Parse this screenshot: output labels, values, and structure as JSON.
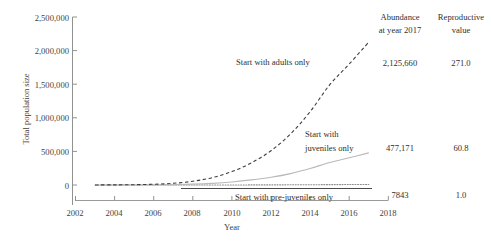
{
  "chart_data": {
    "type": "line",
    "title": "",
    "xlabel": "Year",
    "ylabel": "Total population size",
    "xlim": [
      2002,
      2018
    ],
    "ylim": [
      0,
      2500000
    ],
    "xticks": [
      "2002",
      "2004",
      "2006",
      "2008",
      "2010",
      "2012",
      "2014",
      "2016",
      "2018"
    ],
    "xtick_values": [
      2002,
      2004,
      2006,
      2008,
      2010,
      2012,
      2014,
      2016,
      2018
    ],
    "yticks": [
      "0",
      "500,000",
      "1,000,000",
      "1,500,000",
      "2,000,000",
      "2,500,000"
    ],
    "ytick_values": [
      0,
      500000,
      1000000,
      1500000,
      2000000,
      2500000
    ],
    "grid": false,
    "legend_position": "inline-annotations",
    "x": [
      2003,
      2004,
      2005,
      2006,
      2007,
      2008,
      2009,
      2010,
      2011,
      2012,
      2013,
      2014,
      2015,
      2016,
      2017
    ],
    "series": [
      {
        "name": "Start with adults only",
        "style": "dashed",
        "color": "#3d3d3d",
        "values": [
          900,
          2100,
          4800,
          11000,
          25000,
          56000,
          110000,
          200000,
          330000,
          510000,
          760000,
          1090000,
          1490000,
          1800000,
          2125660
        ]
      },
      {
        "name": "Start with juveniles only",
        "style": "solid",
        "color": "#b9b9b9",
        "values": [
          200,
          480,
          1100,
          2500,
          5700,
          12500,
          25000,
          45000,
          75000,
          115000,
          170000,
          245000,
          335000,
          405000,
          477171
        ]
      },
      {
        "name": "Start with pre-juveniles only",
        "style": "dotted",
        "color": "#8c8c8c",
        "values": [
          3,
          8,
          18,
          41,
          94,
          205,
          410,
          740,
          1220,
          1890,
          2800,
          4030,
          5500,
          6650,
          7843
        ]
      }
    ],
    "annotations": [
      {
        "text": "Start with adults only"
      },
      {
        "text": "Start with"
      },
      {
        "text": "juveniles only"
      },
      {
        "text": "Start with pre-juveniles only"
      }
    ]
  },
  "table": {
    "headers": {
      "abundance_line1": "Abundance",
      "abundance_line2": "at year 2017",
      "reproductive_line1": "Reproductive",
      "reproductive_line2": "value"
    },
    "rows": [
      {
        "abundance": "2,125,660",
        "reproductive": "271.0"
      },
      {
        "abundance": "477,171",
        "reproductive": "60.8"
      },
      {
        "abundance": "7843",
        "reproductive": "1.0"
      }
    ]
  },
  "colors": {
    "background": "#ffffff",
    "text": "#2f2f2f",
    "axis": "#8f8f8f",
    "adults": "#3d3d3d",
    "juveniles": "#b9b9b9",
    "prejuveniles": "#8c8c8c",
    "baseline": "#4a4a4a"
  }
}
